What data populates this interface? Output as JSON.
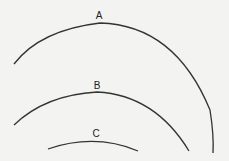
{
  "diagram": {
    "background": "#f3f3f1",
    "stroke_color": "#333333",
    "arcs": [
      {
        "label": "A",
        "path": "M14,64 Q40,30 100,23 Q175,25 210,110 Q214,135 213,153",
        "label_x": 99,
        "label_y": 19
      },
      {
        "label": "B",
        "path": "M14,125 Q45,95 97,92 Q155,95 189,151",
        "label_x": 97,
        "label_y": 89
      },
      {
        "label": "C",
        "path": "M48,149 Q95,133 138,151",
        "label_x": 96,
        "label_y": 137
      }
    ]
  }
}
